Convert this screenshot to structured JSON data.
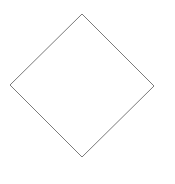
{
  "diagram": {
    "background": "#ffffff",
    "shapes": [
      {
        "type": "diamond",
        "points": [
          [
            82,
            14
          ],
          [
            154,
            86
          ],
          [
            82,
            157
          ],
          [
            10,
            85
          ]
        ],
        "stroke": "#7a7a7a",
        "stroke_width": 1,
        "fill": "#ffffff"
      }
    ]
  }
}
